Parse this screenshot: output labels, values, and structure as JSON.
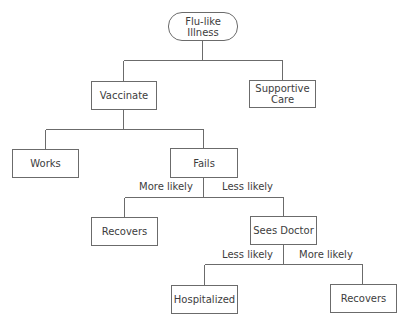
{
  "diagram": {
    "type": "decision-tree",
    "nodes": {
      "root": "Flu-like Illness",
      "vaccinate": "Vaccinate",
      "supportive_care": "Supportive Care",
      "works": "Works",
      "fails": "Fails",
      "recovers_1": "Recovers",
      "sees_doctor": "Sees Doctor",
      "hospitalized": "Hospitalized",
      "recovers_2": "Recovers"
    },
    "edge_labels": {
      "fails_to_recovers": "More likely",
      "fails_to_sees_doctor": "Less likely",
      "doctor_to_hospitalized": "Less likely",
      "doctor_to_recovers": "More likely"
    },
    "edges": [
      {
        "from": "Flu-like Illness",
        "to": "Vaccinate"
      },
      {
        "from": "Flu-like Illness",
        "to": "Supportive Care"
      },
      {
        "from": "Vaccinate",
        "to": "Works"
      },
      {
        "from": "Vaccinate",
        "to": "Fails"
      },
      {
        "from": "Fails",
        "to": "Recovers",
        "label": "More likely"
      },
      {
        "from": "Fails",
        "to": "Sees Doctor",
        "label": "Less likely"
      },
      {
        "from": "Sees Doctor",
        "to": "Hospitalized",
        "label": "Less likely"
      },
      {
        "from": "Sees Doctor",
        "to": "Recovers",
        "label": "More likely"
      }
    ],
    "line_color": "#6b6b6b"
  }
}
